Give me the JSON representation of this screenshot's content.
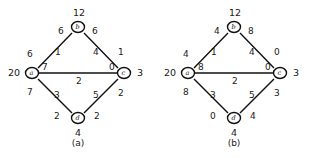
{
  "figure": {
    "caption_a": "(a)",
    "caption_b": "(b)",
    "clipped_text": "",
    "edge_color": "#111111",
    "node_stroke": "#111111",
    "text_color": "#1a1a1a"
  },
  "panel_a": {
    "label": "(a)",
    "nodes": [
      {
        "id": "a",
        "name": "a",
        "value": "20",
        "x": 32,
        "y": 73
      },
      {
        "id": "b",
        "name": "b",
        "value": "12",
        "x": 78,
        "y": 27
      },
      {
        "id": "c",
        "name": "c",
        "value": "3",
        "x": 124,
        "y": 73
      },
      {
        "id": "d",
        "name": "d",
        "value": "4",
        "x": 78,
        "y": 118
      }
    ],
    "edges": [
      {
        "from": "a",
        "to": "b",
        "weight": "1",
        "tail_label": "6",
        "head_label": "6"
      },
      {
        "from": "b",
        "to": "c",
        "weight": "4",
        "tail_label": "6",
        "head_label": "1"
      },
      {
        "from": "a",
        "to": "c",
        "weight": "2",
        "tail_label": "7",
        "head_label": "0"
      },
      {
        "from": "a",
        "to": "d",
        "weight": "3",
        "tail_label": "7",
        "head_label": "2"
      },
      {
        "from": "d",
        "to": "c",
        "weight": "5",
        "tail_label": "2",
        "head_label": "2"
      }
    ]
  },
  "panel_b": {
    "label": "(b)",
    "nodes": [
      {
        "id": "a",
        "name": "a",
        "value": "20",
        "x": 32,
        "y": 73
      },
      {
        "id": "b",
        "name": "b",
        "value": "12",
        "x": 78,
        "y": 27
      },
      {
        "id": "c",
        "name": "c",
        "value": "3",
        "x": 124,
        "y": 73
      },
      {
        "id": "d",
        "name": "d",
        "value": "4",
        "x": 78,
        "y": 118
      }
    ],
    "edges": [
      {
        "from": "a",
        "to": "b",
        "weight": "1",
        "tail_label": "4",
        "head_label": "4"
      },
      {
        "from": "b",
        "to": "c",
        "weight": "4",
        "tail_label": "8",
        "head_label": "0"
      },
      {
        "from": "a",
        "to": "c",
        "weight": "2",
        "tail_label": "8",
        "head_label": "0"
      },
      {
        "from": "a",
        "to": "d",
        "weight": "3",
        "tail_label": "8",
        "head_label": "0"
      },
      {
        "from": "d",
        "to": "c",
        "weight": "5",
        "tail_label": "4",
        "head_label": "3"
      }
    ]
  }
}
